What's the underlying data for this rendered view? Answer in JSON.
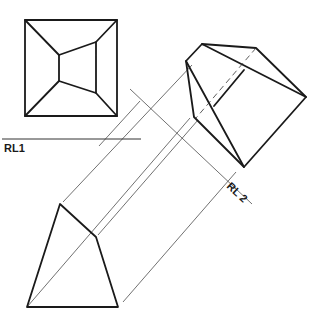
{
  "diagram": {
    "labels": {
      "reference_line_1": "RL1",
      "reference_line_2": "RL 2"
    },
    "views": [
      {
        "name": "plan-view",
        "description": "square frustum top view (offset inner face)"
      },
      {
        "name": "auxiliary-elevation",
        "description": "frustum projected onto RL2"
      },
      {
        "name": "auxiliary-view-2",
        "description": "quadrilateral end view"
      }
    ],
    "line_color": "#1a1a1a"
  }
}
